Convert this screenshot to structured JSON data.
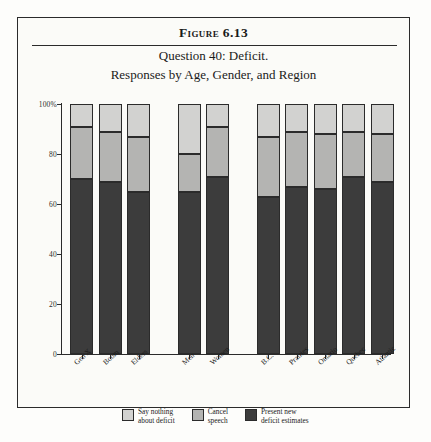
{
  "figure": {
    "number": "Figure 6.13",
    "subtitle_1": "Question 40: Deficit.",
    "subtitle_2": "Responses by Age, Gender, and Region"
  },
  "legend": {
    "items": [
      {
        "label_line1": "Say nothing",
        "label_line2": "about deficit",
        "color": "#d2d2d0",
        "name": "say-nothing-about-deficit"
      },
      {
        "label_line1": "Cancel",
        "label_line2": "speech",
        "color": "#b4b4b2",
        "name": "cancel-speech"
      },
      {
        "label_line1": "Present new",
        "label_line2": "deficit estimates",
        "color": "#3c3c3c",
        "name": "present-new-deficit-estimates"
      }
    ]
  },
  "axis": {
    "y_ticks": [
      "100%",
      "80",
      "60",
      "40",
      "20",
      "0"
    ],
    "y_values": [
      100,
      80,
      60,
      40,
      20,
      0
    ]
  },
  "chart_data": {
    "type": "bar",
    "stacked": true,
    "subtitle": "Responses by Age, Gender, and Region",
    "xlabel": "",
    "ylabel": "",
    "ylim": [
      0,
      100
    ],
    "grid": false,
    "legend_position": "bottom",
    "categories": [
      "Gen X",
      "Boom",
      "Elders",
      "Men",
      "Women",
      "B.C.",
      "Prairies",
      "Ontario",
      "Quebec",
      "Atlantic"
    ],
    "groups": [
      {
        "name": "Age",
        "categories": [
          "Gen X",
          "Boom",
          "Elders"
        ]
      },
      {
        "name": "Gender",
        "categories": [
          "Men",
          "Women"
        ]
      },
      {
        "name": "Region",
        "categories": [
          "B.C.",
          "Prairies",
          "Ontario",
          "Quebec",
          "Atlantic"
        ]
      }
    ],
    "series": [
      {
        "name": "Present new deficit estimates",
        "color": "#3c3c3c",
        "values": [
          70,
          69,
          65,
          65,
          71,
          63,
          67,
          66,
          71,
          69
        ]
      },
      {
        "name": "Cancel speech",
        "color": "#b4b4b2",
        "values": [
          21,
          20,
          22,
          15,
          20,
          24,
          22,
          22,
          18,
          19
        ]
      },
      {
        "name": "Say nothing about deficit",
        "color": "#d2d2d0",
        "values": [
          9,
          11,
          13,
          20,
          9,
          13,
          11,
          12,
          11,
          12
        ]
      }
    ]
  }
}
